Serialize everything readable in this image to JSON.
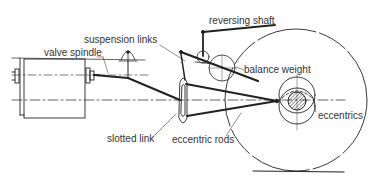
{
  "diagram": {
    "type": "mechanical schematic",
    "labels": {
      "reversing_shaft": "reversing shaft",
      "suspension_links": "suspension links",
      "valve_spindle": "valve spindle",
      "balance_weight": "balance weight",
      "slotted_link": "slotted link",
      "eccentric_rods": "eccentric rods",
      "eccentrics": "eccentrics"
    },
    "colors": {
      "line": "#222222",
      "text": "#333333",
      "background": "#ffffff"
    }
  }
}
